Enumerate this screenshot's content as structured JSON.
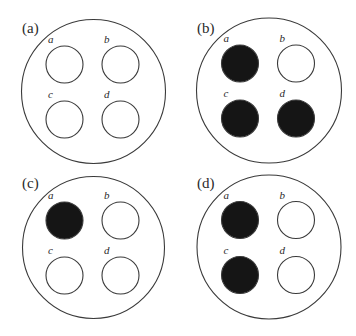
{
  "figure": {
    "colors": {
      "filled": "#151515",
      "empty": "#ffffff",
      "stroke": "#3a3a3a"
    },
    "panels": [
      {
        "label": "(a)",
        "wells": [
          {
            "label": "a",
            "filled": false
          },
          {
            "label": "b",
            "filled": false
          },
          {
            "label": "c",
            "filled": false
          },
          {
            "label": "d",
            "filled": false
          }
        ]
      },
      {
        "label": "(b)",
        "wells": [
          {
            "label": "a",
            "filled": true
          },
          {
            "label": "b",
            "filled": false
          },
          {
            "label": "c",
            "filled": true
          },
          {
            "label": "d",
            "filled": true
          }
        ]
      },
      {
        "label": "(c)",
        "wells": [
          {
            "label": "a",
            "filled": true
          },
          {
            "label": "b",
            "filled": false
          },
          {
            "label": "c",
            "filled": false
          },
          {
            "label": "d",
            "filled": false
          }
        ]
      },
      {
        "label": "(d)",
        "wells": [
          {
            "label": "a",
            "filled": true
          },
          {
            "label": "b",
            "filled": false
          },
          {
            "label": "c",
            "filled": true
          },
          {
            "label": "d",
            "filled": false
          }
        ]
      }
    ]
  }
}
